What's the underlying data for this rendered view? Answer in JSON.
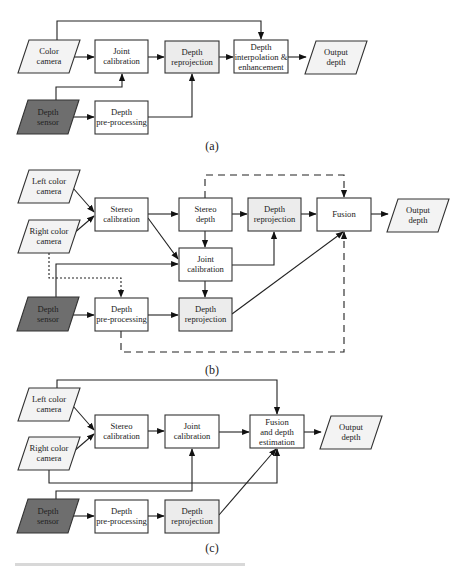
{
  "colors": {
    "box_fill": "#ffffff",
    "reprojection_fill": "#ececec",
    "input_fill": "#f3f3f3",
    "sensor_fill": "#6e6e6e",
    "stroke": "#333333"
  },
  "diagram_a": {
    "caption": "(a)",
    "color_camera": [
      "Color",
      "camera"
    ],
    "joint_calibration": [
      "Joint",
      "calibration"
    ],
    "depth_reprojection": [
      "Depth",
      "reprojection"
    ],
    "depth_interpolation": [
      "Depth",
      "interpolation &",
      "enhancement"
    ],
    "output_depth": [
      "Output",
      "depth"
    ],
    "depth_sensor": [
      "Depth",
      "sensor"
    ],
    "depth_preprocessing": [
      "Depth",
      "pre-processing"
    ]
  },
  "diagram_b": {
    "caption": "(b)",
    "left_color_camera": [
      "Left color",
      "camera"
    ],
    "right_color_camera": [
      "Right color",
      "camera"
    ],
    "stereo_calibration": [
      "Stereo",
      "calibration"
    ],
    "stereo_depth": [
      "Stereo",
      "depth"
    ],
    "depth_reprojection_top": [
      "Depth",
      "reprojection"
    ],
    "fusion": [
      "Fusion"
    ],
    "output_depth": [
      "Output",
      "depth"
    ],
    "joint_calibration": [
      "Joint",
      "calibration"
    ],
    "depth_sensor": [
      "Depth",
      "sensor"
    ],
    "depth_preprocessing": [
      "Depth",
      "pre-processing"
    ],
    "depth_reprojection_bottom": [
      "Depth",
      "reprojection"
    ]
  },
  "diagram_c": {
    "caption": "(c)",
    "left_color_camera": [
      "Left color",
      "camera"
    ],
    "right_color_camera": [
      "Right color",
      "camera"
    ],
    "stereo_calibration": [
      "Stereo",
      "calibration"
    ],
    "joint_calibration": [
      "Joint",
      "calibration"
    ],
    "fusion_depth_estimation": [
      "Fusion",
      "and depth",
      "estimation"
    ],
    "output_depth": [
      "Output",
      "depth"
    ],
    "depth_sensor": [
      "Depth",
      "sensor"
    ],
    "depth_preprocessing": [
      "Depth",
      "pre-processing"
    ],
    "depth_reprojection": [
      "Depth",
      "reprojection"
    ]
  }
}
